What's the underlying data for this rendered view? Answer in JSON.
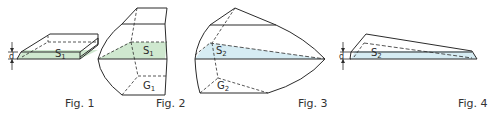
{
  "figures": [
    {
      "caption": "Fig. 1",
      "shape": "flat slab",
      "section_label": "S",
      "section_sub": "1",
      "dimension_label": "d",
      "section_color": "#cfe8cf"
    },
    {
      "caption": "Fig. 2",
      "shape": "curved block",
      "section_label": "S",
      "section_sub": "1",
      "centroid_label": "G",
      "centroid_sub": "1",
      "section_color": "#cfe8cf"
    },
    {
      "caption": "Fig. 3",
      "shape": "lens-shaped solid",
      "section_label": "S",
      "section_sub": "2",
      "centroid_label": "G",
      "centroid_sub": "2",
      "section_color": "#d6ecf3"
    },
    {
      "caption": "Fig. 4",
      "shape": "thin wedge",
      "section_label": "S",
      "section_sub": "2",
      "dimension_label": "d",
      "section_color": "#d6ecf3"
    }
  ],
  "colors": {
    "line": "#2b2b2b",
    "green_fill": "#cfe8cf",
    "blue_fill": "#d6ecf3",
    "background": "#ffffff"
  }
}
